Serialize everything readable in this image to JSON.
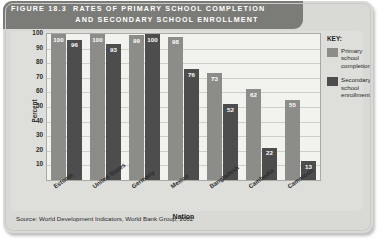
{
  "figure": {
    "label": "FIGURE",
    "number": "18.3",
    "title_line1": "RATES OF PRIMARY SCHOOL COMPLETION",
    "title_line2": "AND SECONDARY SCHOOL ENROLLMENT",
    "source": "Source: World Development Indicators, World Bank Group, 2002"
  },
  "legend": {
    "title": "KEY:",
    "items": [
      {
        "label": "Primary school completion",
        "color": "#8c8c88"
      },
      {
        "label": "Secondary school enrollment",
        "color": "#4d4d4d"
      }
    ]
  },
  "chart_data": {
    "type": "bar",
    "title": "RATES OF PRIMARY SCHOOL COMPLETION AND SECONDARY SCHOOL ENROLLMENT",
    "xlabel": "Nation",
    "ylabel": "Percent",
    "ylim": [
      0,
      100
    ],
    "yticks": [
      100,
      90,
      80,
      70,
      60,
      50,
      40,
      30,
      20,
      10
    ],
    "grid": true,
    "legend_position": "right",
    "categories": [
      "Estonia",
      "United States",
      "Germany",
      "Mexico",
      "Bangladesh",
      "Cambodia",
      "Cameroon"
    ],
    "series": [
      {
        "name": "Primary school completion",
        "color": "#8c8c88",
        "values": [
          100,
          100,
          99,
          98,
          73,
          62,
          55
        ]
      },
      {
        "name": "Secondary school enrollment",
        "color": "#4d4d4d",
        "values": [
          96,
          93,
          100,
          76,
          52,
          22,
          13
        ]
      }
    ]
  }
}
